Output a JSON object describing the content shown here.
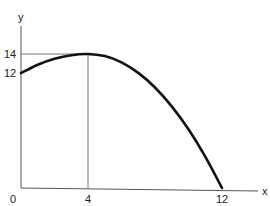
{
  "chart_data": {
    "type": "line",
    "title": "",
    "xlabel": "x",
    "ylabel": "y",
    "xlim": [
      0,
      13.5
    ],
    "ylim": [
      0,
      15.5
    ],
    "x_ticks": [
      {
        "value": 0,
        "label": "0"
      },
      {
        "value": 4,
        "label": "4"
      },
      {
        "value": 12,
        "label": "12"
      }
    ],
    "y_ticks": [
      {
        "value": 12,
        "label": "12"
      },
      {
        "value": 14,
        "label": "14"
      }
    ],
    "grid": false,
    "series": [
      {
        "name": "curve",
        "color": "#111111",
        "points": [
          [
            0,
            12
          ],
          [
            1,
            12.875
          ],
          [
            2,
            13.5
          ],
          [
            3,
            13.875
          ],
          [
            4,
            14
          ],
          [
            5,
            13.78
          ],
          [
            6,
            13.13
          ],
          [
            7,
            12.03
          ],
          [
            8,
            10.5
          ],
          [
            9,
            8.53
          ],
          [
            10,
            6.13
          ],
          [
            11,
            3.28
          ],
          [
            12,
            0
          ]
        ]
      }
    ],
    "annotations": [
      {
        "type": "guide-line",
        "description": "vertical from x-axis to peak",
        "x": 4,
        "y": 14
      },
      {
        "type": "guide-line",
        "description": "horizontal from y-axis to peak",
        "x": 4,
        "y": 14
      }
    ]
  }
}
